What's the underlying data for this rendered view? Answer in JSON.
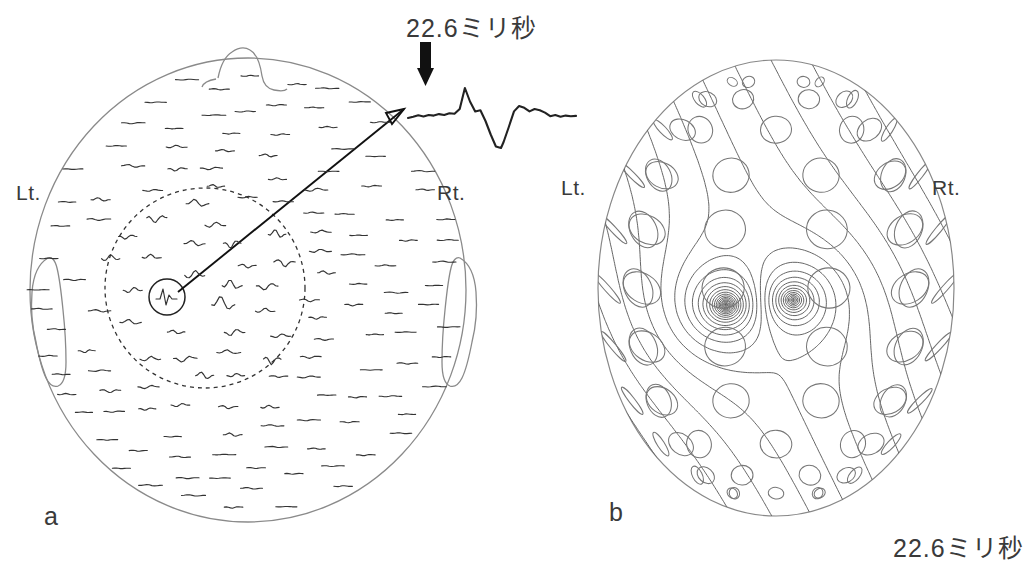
{
  "figure": {
    "type": "meg-field-map-figure",
    "background_color": "#ffffff",
    "ink_color": "#333333"
  },
  "panel_a": {
    "label": "a",
    "left_label": "Lt.",
    "right_label": "Rt.",
    "description": "Flattened head map with MEG sensor waveform traces; dashed circle marks responsive region; small circle marks the highlighted channel",
    "head": {
      "cx": 248,
      "cy": 290,
      "rx": 218,
      "ry": 232,
      "nose": "top",
      "ears": [
        "left",
        "right"
      ]
    },
    "dashed_region": {
      "cx": 205,
      "cy": 288,
      "r": 100
    },
    "highlighted_channel": {
      "cx": 167,
      "cy": 297,
      "r": 18
    },
    "trace_count": 148
  },
  "waveform": {
    "time_label": "22.6ミリ秒",
    "arrow": "down-arrow-marker",
    "peak_marker_x": 424,
    "description": "Enlarged averaged MEG response of the highlighted channel with sharp peak at 22.6 ms"
  },
  "panel_b": {
    "label": "b",
    "left_label": "Lt.",
    "right_label": "Rt.",
    "time_label": "22.6ミリ秒",
    "description": "Three-dimensional isofield contour map on the head surface with sensor coil circles; dipolar focus over the left hemisphere"
  },
  "chart_data": {
    "type": "line",
    "title": "22.6ミリ秒",
    "xlabel": "",
    "ylabel": "",
    "series": [
      {
        "name": "evoked-response",
        "x": [
          0,
          4,
          8,
          12,
          16,
          20,
          24,
          28,
          32,
          36,
          40,
          44,
          48,
          52,
          56,
          60,
          64,
          68,
          72,
          74,
          78,
          82,
          86,
          90,
          94,
          98,
          102,
          106,
          110,
          114,
          118,
          122,
          126,
          130
        ],
        "y": [
          0.0,
          0.04,
          0.09,
          0.05,
          0.1,
          0.08,
          0.13,
          0.1,
          0.16,
          0.14,
          0.3,
          1.0,
          0.55,
          0.22,
          0.26,
          -0.1,
          -0.55,
          -0.95,
          -1.0,
          -0.8,
          -0.3,
          0.22,
          0.4,
          0.34,
          0.22,
          0.3,
          0.26,
          0.18,
          0.06,
          0.1,
          0.04,
          0.08,
          0.06,
          0.07
        ],
        "peak_time_label": "22.6ミリ秒"
      }
    ],
    "annotations": [
      {
        "name": "peak-arrow",
        "label": "22.6ミリ秒",
        "x": 44,
        "y": 1.0
      }
    ]
  }
}
